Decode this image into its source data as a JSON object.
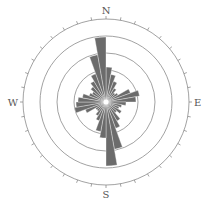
{
  "chart_data": {
    "type": "rose",
    "title": "",
    "center": [
      106,
      102
    ],
    "bin_size_deg": 10,
    "ring_radii_px": [
      32,
      49,
      66,
      83
    ],
    "outer_ring_radius_px": 83,
    "tick_interval_deg": 10,
    "labels": {
      "N": "N",
      "E": "E",
      "S": "S",
      "W": "W"
    },
    "petal_color": "#6b6b6b",
    "ring_color": "#8a8a8a",
    "bins": [
      {
        "from": 0,
        "to": 10,
        "radius": 35
      },
      {
        "from": 10,
        "to": 20,
        "radius": 28
      },
      {
        "from": 20,
        "to": 30,
        "radius": 22
      },
      {
        "from": 30,
        "to": 40,
        "radius": 16
      },
      {
        "from": 40,
        "to": 50,
        "radius": 12
      },
      {
        "from": 50,
        "to": 60,
        "radius": 14
      },
      {
        "from": 60,
        "to": 70,
        "radius": 26
      },
      {
        "from": 70,
        "to": 80,
        "radius": 34
      },
      {
        "from": 80,
        "to": 90,
        "radius": 30
      },
      {
        "from": 90,
        "to": 100,
        "radius": 20
      },
      {
        "from": 100,
        "to": 110,
        "radius": 16
      },
      {
        "from": 110,
        "to": 120,
        "radius": 14
      },
      {
        "from": 120,
        "to": 130,
        "radius": 18
      },
      {
        "from": 130,
        "to": 140,
        "radius": 14
      },
      {
        "from": 140,
        "to": 150,
        "radius": 22
      },
      {
        "from": 150,
        "to": 160,
        "radius": 28
      },
      {
        "from": 160,
        "to": 170,
        "radius": 48
      },
      {
        "from": 170,
        "to": 180,
        "radius": 64
      },
      {
        "from": 180,
        "to": 190,
        "radius": 36
      },
      {
        "from": 190,
        "to": 200,
        "radius": 30
      },
      {
        "from": 200,
        "to": 210,
        "radius": 20
      },
      {
        "from": 210,
        "to": 220,
        "radius": 16
      },
      {
        "from": 220,
        "to": 230,
        "radius": 12
      },
      {
        "from": 230,
        "to": 240,
        "radius": 12
      },
      {
        "from": 240,
        "to": 250,
        "radius": 22
      },
      {
        "from": 250,
        "to": 260,
        "radius": 32
      },
      {
        "from": 260,
        "to": 270,
        "radius": 30
      },
      {
        "from": 270,
        "to": 280,
        "radius": 28
      },
      {
        "from": 280,
        "to": 290,
        "radius": 24
      },
      {
        "from": 290,
        "to": 300,
        "radius": 18
      },
      {
        "from": 300,
        "to": 310,
        "radius": 16
      },
      {
        "from": 310,
        "to": 320,
        "radius": 20
      },
      {
        "from": 320,
        "to": 330,
        "radius": 24
      },
      {
        "from": 330,
        "to": 340,
        "radius": 30
      },
      {
        "from": 340,
        "to": 350,
        "radius": 48
      },
      {
        "from": 350,
        "to": 360,
        "radius": 65
      }
    ]
  }
}
